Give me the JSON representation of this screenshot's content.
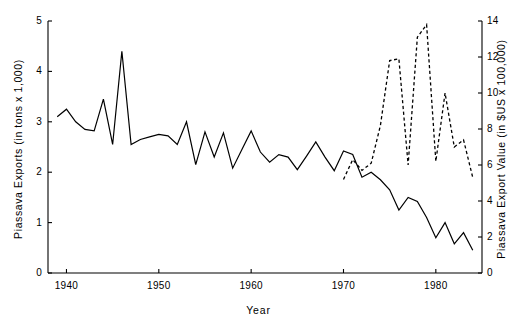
{
  "chart_data": {
    "type": "line",
    "title": "",
    "xlabel": "Year",
    "ylabel": "Piassava Exports  (in tons x 1,000)",
    "y2label": "Piassava Export Value  (in $US x 100,000)",
    "xlim": [
      1938,
      1985
    ],
    "ylim": [
      0,
      5
    ],
    "y2lim": [
      0,
      14
    ],
    "grid": false,
    "legend_position": "none",
    "x_ticks": [
      1940,
      1950,
      1960,
      1970,
      1980
    ],
    "x_tick_labels": [
      "1940",
      "1950",
      "1960",
      "1970",
      "1980"
    ],
    "y_ticks": [
      0,
      1,
      2,
      3,
      4,
      5
    ],
    "y_tick_labels": [
      "0",
      "1",
      "2",
      "3",
      "4",
      "5"
    ],
    "y2_ticks": [
      0,
      2,
      4,
      6,
      8,
      10,
      12,
      14
    ],
    "y2_tick_labels": [
      "0",
      "2",
      "4",
      "6",
      "8",
      "10",
      "12",
      "14"
    ],
    "series": [
      {
        "name": "Piassava Exports (tons x 1,000)",
        "axis": "left",
        "style": "solid",
        "color": "#000000",
        "x": [
          1939,
          1940,
          1941,
          1942,
          1943,
          1944,
          1945,
          1946,
          1947,
          1948,
          1949,
          1950,
          1951,
          1952,
          1953,
          1954,
          1955,
          1956,
          1957,
          1958,
          1959,
          1960,
          1961,
          1962,
          1963,
          1964,
          1965,
          1966,
          1967,
          1968,
          1969,
          1970,
          1971,
          1972,
          1973,
          1974,
          1975,
          1976,
          1977,
          1978,
          1979,
          1980,
          1981,
          1982,
          1983,
          1984
        ],
        "values": [
          3.1,
          3.25,
          3.0,
          2.85,
          2.82,
          3.45,
          2.55,
          4.4,
          2.55,
          2.65,
          2.7,
          2.75,
          2.72,
          2.55,
          3.0,
          2.15,
          2.8,
          2.3,
          2.78,
          2.08,
          2.45,
          2.82,
          2.4,
          2.2,
          2.35,
          2.3,
          2.05,
          2.32,
          2.6,
          2.3,
          2.03,
          2.42,
          2.35,
          1.9,
          2.0,
          1.85,
          1.65,
          1.25,
          1.5,
          1.42,
          1.1,
          0.7,
          1.0,
          0.58,
          0.8,
          0.45
        ]
      },
      {
        "name": "Piassava Export Value ($US x 100,000)",
        "axis": "right",
        "style": "dashed",
        "color": "#000000",
        "x": [
          1970,
          1971,
          1972,
          1973,
          1974,
          1975,
          1976,
          1977,
          1978,
          1979,
          1980,
          1981,
          1982,
          1983,
          1984
        ],
        "values": [
          5.2,
          6.3,
          5.7,
          6.1,
          8.2,
          11.8,
          11.9,
          6.0,
          13.1,
          13.8,
          6.2,
          10.0,
          7.0,
          7.4,
          5.3
        ]
      }
    ]
  },
  "axes": {
    "left_title": "Piassava Exports  (in tons x 1,000)",
    "right_title": "Piassava Export Value  (in $US x 100,000)",
    "x_title": "Year"
  }
}
